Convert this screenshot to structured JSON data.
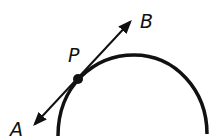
{
  "diagram": {
    "labels": {
      "a": "A",
      "b": "B",
      "p": "P"
    },
    "colors": {
      "stroke": "#111111",
      "background": "#ffffff"
    }
  }
}
